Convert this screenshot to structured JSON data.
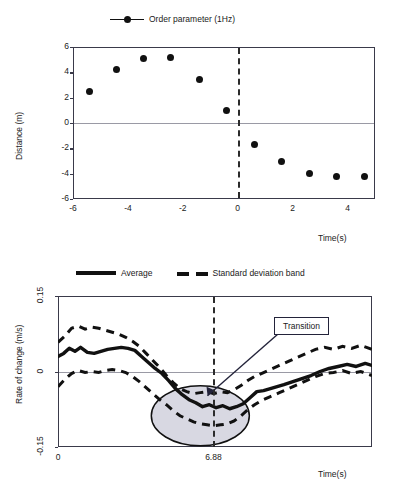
{
  "figure": {
    "panels": [
      "order-parameter-scatter",
      "rate-of-change-timeseries"
    ]
  },
  "chart_data": [
    {
      "type": "scatter",
      "title": "",
      "xlabel": "Time(s)",
      "ylabel": "Distance (m)",
      "xlim": [
        -6,
        5
      ],
      "ylim": [
        -6,
        6
      ],
      "xticks": [
        "-6",
        "-4",
        "-2",
        "0",
        "2",
        "4"
      ],
      "xtick_values": [
        -6,
        -4,
        -2,
        0,
        2,
        4
      ],
      "yticks": [
        "6",
        "4",
        "2",
        "0",
        "-2",
        "-4",
        "-6"
      ],
      "ytick_values": [
        6,
        4,
        2,
        0,
        -2,
        -4,
        -6
      ],
      "grid": false,
      "zero_line": true,
      "legend": [
        {
          "label": "Order parameter (1Hz)",
          "marker": "filled-circle",
          "line": "solid",
          "color": "#111111"
        }
      ],
      "legend_position": "above-plot-center",
      "annotations": [
        {
          "kind": "vertical-dashed-line",
          "x": 0,
          "label": ""
        }
      ],
      "series": [
        {
          "name": "Order parameter (1Hz)",
          "x": [
            -5.4,
            -4.4,
            -3.45,
            -2.45,
            -1.4,
            -0.4,
            0.62,
            1.6,
            2.6,
            3.6,
            4.6
          ],
          "y": [
            2.45,
            4.25,
            5.1,
            5.2,
            3.45,
            0.95,
            -1.7,
            -3.05,
            -4.0,
            -4.25,
            -4.25
          ]
        }
      ]
    },
    {
      "type": "line",
      "title": "",
      "xlabel": "Time(s)",
      "ylabel": "Rate of change (m/s)",
      "xlim": [
        0,
        13.9
      ],
      "ylim": [
        -0.15,
        0.15
      ],
      "xticks": [
        "0",
        "6.88"
      ],
      "xtick_values": [
        0,
        6.88
      ],
      "yticks": [
        "0.15",
        "0",
        "-0.15"
      ],
      "ytick_values": [
        0.15,
        0,
        -0.15
      ],
      "grid": false,
      "zero_line": true,
      "legend": [
        {
          "label": "Average",
          "line": "solid",
          "color": "#111111"
        },
        {
          "label": "Standard deviation band",
          "line": "dashed",
          "color": "#111111"
        }
      ],
      "legend_position": "above-plot-center",
      "annotations": [
        {
          "kind": "vertical-dashed-line",
          "x": 6.88,
          "label": ""
        },
        {
          "kind": "callout-box",
          "text": "Transition",
          "points_to_x": 6.6,
          "points_to_y": -0.055
        },
        {
          "kind": "highlight-ellipse",
          "center_x": 6.3,
          "center_y": -0.088,
          "fill": "#d8d8e2",
          "stroke": "#111111"
        }
      ],
      "series": [
        {
          "name": "Average",
          "x": [
            0.0,
            0.25,
            0.5,
            0.75,
            1.0,
            1.3,
            1.6,
            1.9,
            2.2,
            2.5,
            2.8,
            3.1,
            3.4,
            3.7,
            4.0,
            4.3,
            4.6,
            4.9,
            5.2,
            5.5,
            5.8,
            6.1,
            6.4,
            6.7,
            7.0,
            7.3,
            7.6,
            7.9,
            8.2,
            8.5,
            8.8,
            9.1,
            9.4,
            9.7,
            10.0,
            10.4,
            10.8,
            11.2,
            11.6,
            12.0,
            12.4,
            12.8,
            13.2,
            13.6,
            13.9
          ],
          "y": [
            0.03,
            0.036,
            0.046,
            0.04,
            0.048,
            0.038,
            0.036,
            0.04,
            0.044,
            0.046,
            0.048,
            0.046,
            0.042,
            0.03,
            0.018,
            0.006,
            -0.004,
            -0.018,
            -0.034,
            -0.046,
            -0.056,
            -0.062,
            -0.07,
            -0.066,
            -0.072,
            -0.068,
            -0.074,
            -0.07,
            -0.064,
            -0.052,
            -0.04,
            -0.038,
            -0.034,
            -0.03,
            -0.026,
            -0.02,
            -0.014,
            -0.008,
            0.0,
            0.006,
            0.01,
            0.014,
            0.01,
            0.016,
            0.012
          ]
        },
        {
          "name": "Standard deviation band (upper)",
          "x": [
            0.0,
            0.3,
            0.6,
            0.9,
            1.2,
            1.5,
            1.8,
            2.1,
            2.4,
            2.7,
            3.0,
            3.3,
            3.6,
            3.9,
            4.2,
            4.5,
            4.8,
            5.1,
            5.4,
            5.7,
            6.0,
            6.3,
            6.6,
            6.9,
            7.2,
            7.5,
            7.8,
            8.1,
            8.4,
            8.7,
            9.0,
            9.4,
            9.8,
            10.2,
            10.6,
            11.0,
            11.4,
            11.8,
            12.2,
            12.6,
            13.0,
            13.4,
            13.9
          ],
          "y": [
            0.058,
            0.07,
            0.086,
            0.09,
            0.084,
            0.088,
            0.086,
            0.082,
            0.078,
            0.074,
            0.068,
            0.06,
            0.05,
            0.036,
            0.022,
            0.008,
            -0.008,
            -0.022,
            -0.034,
            -0.04,
            -0.044,
            -0.042,
            -0.04,
            -0.044,
            -0.04,
            -0.042,
            -0.036,
            -0.028,
            -0.018,
            -0.01,
            -0.004,
            0.004,
            0.012,
            0.02,
            0.028,
            0.036,
            0.044,
            0.048,
            0.044,
            0.05,
            0.046,
            0.052,
            0.044
          ]
        },
        {
          "name": "Standard deviation band (lower)",
          "x": [
            0.0,
            0.3,
            0.6,
            0.9,
            1.2,
            1.5,
            1.8,
            2.1,
            2.4,
            2.7,
            3.0,
            3.3,
            3.6,
            3.9,
            4.2,
            4.5,
            4.8,
            5.1,
            5.4,
            5.7,
            6.0,
            6.3,
            6.6,
            6.9,
            7.2,
            7.5,
            7.8,
            8.1,
            8.4,
            8.7,
            9.0,
            9.4,
            9.8,
            10.2,
            10.6,
            11.0,
            11.4,
            11.8,
            12.2,
            12.6,
            13.0,
            13.4,
            13.9
          ],
          "y": [
            -0.03,
            -0.016,
            -0.004,
            0.002,
            -0.002,
            0.0,
            -0.002,
            0.002,
            0.004,
            0.002,
            -0.002,
            -0.01,
            -0.02,
            -0.032,
            -0.044,
            -0.056,
            -0.066,
            -0.078,
            -0.088,
            -0.094,
            -0.1,
            -0.104,
            -0.106,
            -0.108,
            -0.106,
            -0.104,
            -0.098,
            -0.088,
            -0.076,
            -0.066,
            -0.058,
            -0.05,
            -0.042,
            -0.034,
            -0.026,
            -0.018,
            -0.01,
            -0.004,
            -0.002,
            0.002,
            -0.004,
            0.0,
            -0.008
          ]
        }
      ]
    }
  ]
}
